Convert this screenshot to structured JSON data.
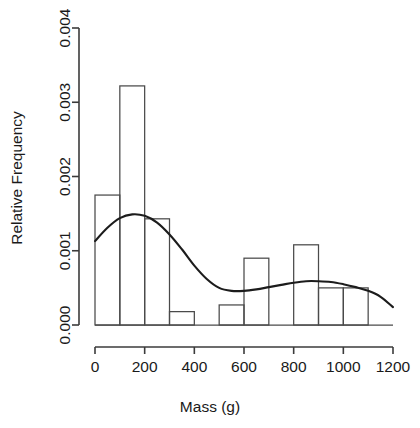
{
  "chart_data": {
    "type": "bar",
    "title": "",
    "subtitle": "",
    "xlabel": "Mass (g)",
    "ylabel": "Relative Frequency",
    "xlim": [
      0,
      1200
    ],
    "ylim": [
      0,
      0.004
    ],
    "grid": false,
    "legend": "none",
    "bin_width": 100,
    "x_ticks": [
      0,
      200,
      400,
      600,
      800,
      1000,
      1200
    ],
    "x_tick_labels": [
      "0",
      "200",
      "400",
      "600",
      "800",
      "1000",
      "1200"
    ],
    "y_ticks": [
      0,
      0.001,
      0.002,
      0.003,
      0.004
    ],
    "y_tick_labels": [
      "0.000",
      "0.001",
      "0.002",
      "0.003",
      "0.004"
    ],
    "bin_edges": [
      0,
      100,
      200,
      300,
      400,
      500,
      600,
      700,
      800,
      900,
      1000,
      1100,
      1200
    ],
    "categories": [
      "0-100",
      "100-200",
      "200-300",
      "300-400",
      "400-500",
      "500-600",
      "600-700",
      "700-800",
      "800-900",
      "900-1000",
      "1000-1100",
      "1100-1200"
    ],
    "values": [
      0.00175,
      0.00322,
      0.00143,
      0.00018,
      0.0,
      0.00027,
      0.0009,
      0.0,
      0.00108,
      0.0005,
      0.0005,
      0.0
    ],
    "series": [
      {
        "name": "Relative Frequency",
        "type": "bar",
        "values": [
          0.00175,
          0.00322,
          0.00143,
          0.00018,
          0.0,
          0.00027,
          0.0009,
          0.0,
          0.00108,
          0.0005,
          0.0005,
          0.0
        ]
      },
      {
        "name": "Density curve",
        "type": "line",
        "x": [
          0,
          50,
          100,
          150,
          200,
          250,
          300,
          350,
          400,
          450,
          500,
          550,
          600,
          650,
          700,
          750,
          800,
          850,
          900,
          950,
          1000,
          1050,
          1100,
          1150,
          1200
        ],
        "values": [
          0.00113,
          0.00131,
          0.00144,
          0.00149,
          0.00147,
          0.00138,
          0.00122,
          0.00102,
          0.0008,
          0.00062,
          0.0005,
          0.00046,
          0.00046,
          0.00048,
          0.00051,
          0.00054,
          0.00057,
          0.00059,
          0.00059,
          0.00058,
          0.00055,
          0.00051,
          0.00046,
          0.00038,
          0.00024
        ]
      }
    ]
  }
}
